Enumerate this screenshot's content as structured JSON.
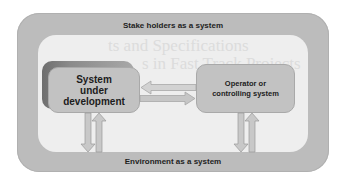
{
  "diagram": {
    "outer_label": "Stake holders as a system",
    "bottom_label": "Environment as a system",
    "watermark_lines": [
      "ts and Specifications",
      "s in Fast Track Projects"
    ],
    "nodes": [
      {
        "id": "sud",
        "lines": [
          "System",
          "under",
          "development"
        ]
      },
      {
        "id": "operator",
        "lines": [
          "Operator or",
          "controlling system"
        ]
      }
    ],
    "edges": [
      {
        "from": "operator",
        "to": "sud",
        "direction": "left"
      },
      {
        "from": "sud",
        "to": "operator",
        "direction": "right"
      },
      {
        "from": "sud",
        "to": "environment",
        "direction": "down"
      },
      {
        "from": "environment",
        "to": "sud",
        "direction": "up"
      },
      {
        "from": "operator",
        "to": "environment",
        "direction": "down"
      },
      {
        "from": "environment",
        "to": "operator",
        "direction": "up"
      }
    ],
    "colors": {
      "outer_fill": "#bcbcbc",
      "inner_fill": "#eeeeee",
      "box_fill": "#c2c2c2",
      "shadow_dark": "#6e6e6e",
      "arrow_fill": "#c8c8c8",
      "arrow_stroke": "#9a9a9a",
      "text": "#1e1e1e"
    }
  }
}
